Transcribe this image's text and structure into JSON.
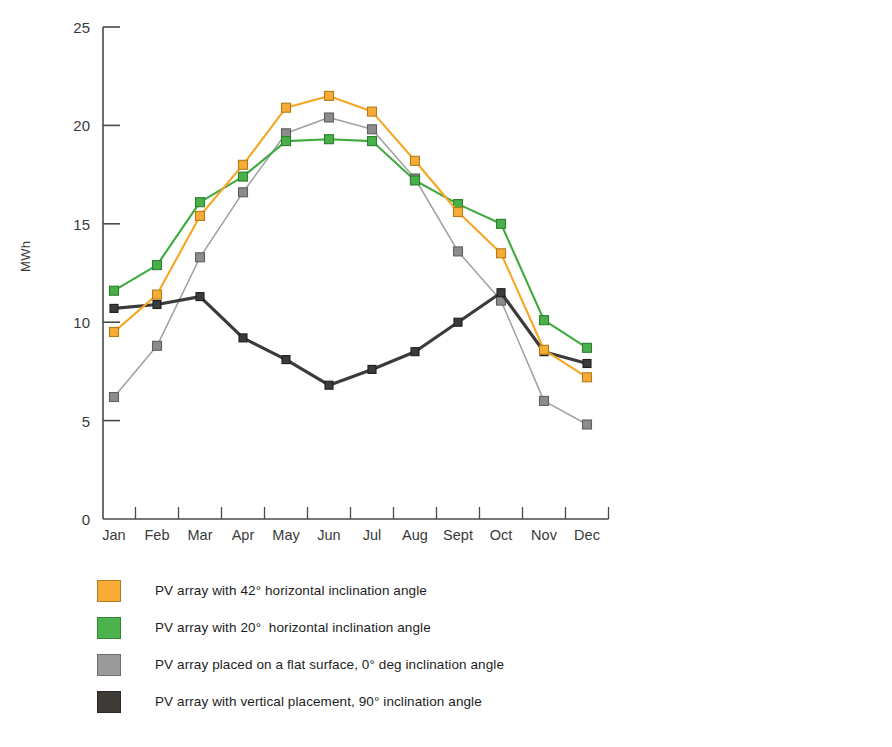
{
  "chart_data": {
    "type": "line",
    "title": "",
    "xlabel": "",
    "ylabel": "MWh",
    "categories": [
      "Jan",
      "Feb",
      "Mar",
      "Apr",
      "May",
      "Jun",
      "Jul",
      "Aug",
      "Sept",
      "Oct",
      "Nov",
      "Dec"
    ],
    "ylim": [
      0,
      25
    ],
    "yticks": [
      0,
      5,
      10,
      15,
      20,
      25
    ],
    "ytick_labels": [
      "0",
      "5",
      "10",
      "15",
      "20",
      "25"
    ],
    "grid": false,
    "legend_position": "below-left",
    "marker": "square",
    "series": [
      {
        "name": "PV array with 42° horizontal inclination angle",
        "color": "#f5a623",
        "marker_fill": "#f6ac35",
        "marker_edge": "#b47b17",
        "values": [
          9.5,
          11.4,
          15.4,
          18.0,
          20.9,
          21.5,
          20.7,
          18.2,
          15.6,
          13.5,
          8.6,
          7.2
        ]
      },
      {
        "name": "PV array with 20°  horizontal inclination angle",
        "color": "#3faa3f",
        "marker_fill": "#49b149",
        "marker_edge": "#2f7d2f",
        "values": [
          11.6,
          12.9,
          16.1,
          17.4,
          19.2,
          19.3,
          19.2,
          17.2,
          16.0,
          15.0,
          10.1,
          8.7
        ]
      },
      {
        "name": "PV array placed on a flat surface, 0° deg inclination angle",
        "color": "#a0a0a0",
        "marker_fill": "#8c8c8c",
        "marker_edge": "#5f5f5f",
        "values": [
          6.2,
          8.8,
          13.3,
          16.6,
          19.6,
          20.4,
          19.8,
          17.3,
          13.6,
          11.1,
          6.0,
          4.8
        ]
      },
      {
        "name": "PV array with vertical placement, 90° inclination angle",
        "color": "#3b3b3b",
        "marker_fill": "#3b3b3b",
        "marker_edge": "#1e1e1e",
        "values": [
          10.7,
          10.9,
          11.3,
          9.2,
          8.1,
          6.8,
          7.6,
          8.5,
          10.0,
          11.5,
          8.5,
          7.9
        ]
      }
    ]
  },
  "axis": {
    "y_title": "MWh"
  },
  "legend": {
    "items": [
      {
        "label": "PV array with 42° horizontal inclination angle",
        "color": "#f6ac35"
      },
      {
        "label": "PV array with 20°  horizontal inclination angle",
        "color": "#4cb24c"
      },
      {
        "label": "PV array placed on a flat surface, 0° deg inclination angle",
        "color": "#9a9a9a"
      },
      {
        "label": "PV array with vertical placement, 90° inclination angle",
        "color": "#3e3a36"
      }
    ]
  }
}
